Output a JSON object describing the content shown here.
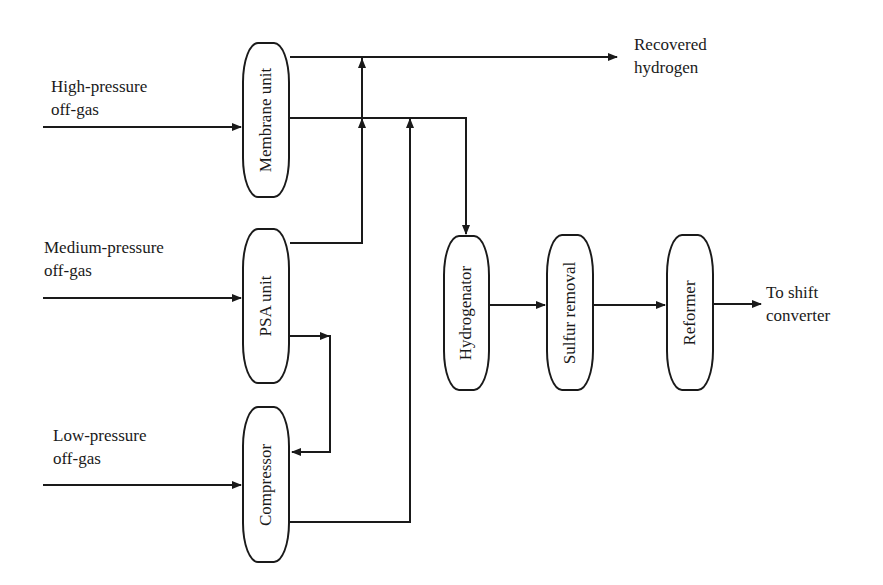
{
  "inputs": {
    "high": {
      "line1": "High-pressure",
      "line2": "off-gas"
    },
    "medium": {
      "line1": "Medium-pressure",
      "line2": "off-gas"
    },
    "low": {
      "line1": "Low-pressure",
      "line2": "off-gas"
    }
  },
  "units": {
    "membrane": "Membrane unit",
    "psa": "PSA unit",
    "compressor": "Compressor",
    "hydrogenator": "Hydrogenator",
    "sulfur": "Sulfur removal",
    "reformer": "Reformer"
  },
  "outputs": {
    "recovered": {
      "line1": "Recovered",
      "line2": "hydrogen"
    },
    "shift": {
      "line1": "To shift",
      "line2": "converter"
    }
  },
  "colors": {
    "stroke": "#1a1a1a",
    "background": "#ffffff"
  }
}
